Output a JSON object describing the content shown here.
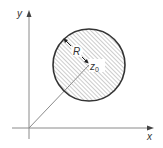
{
  "diagram": {
    "type": "complex-plane-disk",
    "axes": {
      "x_label": "x",
      "y_label": "y"
    },
    "disk": {
      "center_label": "z",
      "center_subscript": "0",
      "radius_label": "R",
      "fill": "hatched",
      "edge_color": "#333333",
      "hatch_color": "#9a9a9a"
    },
    "line_color": "#8a8a8a",
    "axis_color": "#8a8a8a"
  }
}
